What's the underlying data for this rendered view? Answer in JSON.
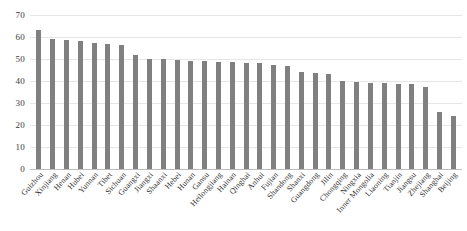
{
  "chart_data": {
    "type": "bar",
    "title": "",
    "subtitle": "",
    "xlabel": "",
    "ylabel": "",
    "ylim": [
      0,
      70
    ],
    "y_ticks": [
      70,
      60,
      50,
      40,
      30,
      20,
      10,
      0
    ],
    "grid": true,
    "legend": "none",
    "bar_color": "#808080",
    "gridline_color": "#e6e6e6",
    "axis_color": "#bdbdbd",
    "categories": [
      "Guizhou",
      "Xinjiang",
      "Henan",
      "Hubei",
      "Yunnan",
      "Tibet",
      "Sichuan",
      "Guangxi",
      "Jiangxi",
      "Shaanxi",
      "Hebei",
      "Hunan",
      "Gansu",
      "Heilongjiang",
      "Hainan",
      "Qinghai",
      "Anhui",
      "Fujian",
      "Shandong",
      "Shanxi",
      "Guangdong",
      "Jilin",
      "Chongqing",
      "Ningxia",
      "Inner Mongolia",
      "Liaoning",
      "Tianjin",
      "Jiangsu",
      "Zhejiang",
      "Shanghai",
      "Beijing"
    ],
    "values": [
      63,
      59,
      58.5,
      58,
      57.5,
      57,
      56.5,
      52,
      50,
      49.8,
      49.5,
      49.3,
      49,
      48.8,
      48.5,
      48.3,
      48,
      47.5,
      47,
      44,
      43.5,
      43,
      40,
      39.5,
      39.3,
      39,
      38.8,
      38.5,
      37.5,
      26,
      24
    ]
  }
}
